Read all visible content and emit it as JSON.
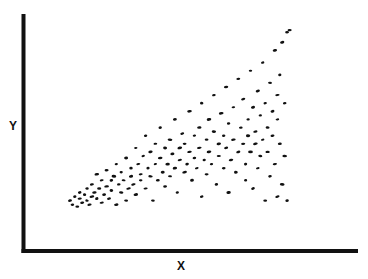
{
  "chart_data": {
    "type": "scatter",
    "title": "",
    "xlabel": "X",
    "ylabel": "Y",
    "xlim": [
      0,
      100
    ],
    "ylim": [
      0,
      100
    ],
    "grid": false,
    "legend": null,
    "ticks": false,
    "marker_color": "#111111",
    "axis_color": "#111111",
    "series": [
      {
        "name": "points",
        "points": [
          [
            9,
            12
          ],
          [
            10,
            10
          ],
          [
            11,
            14
          ],
          [
            12,
            9
          ],
          [
            13,
            13
          ],
          [
            13,
            16
          ],
          [
            14,
            11
          ],
          [
            15,
            15
          ],
          [
            16,
            12
          ],
          [
            16,
            18
          ],
          [
            17,
            10
          ],
          [
            18,
            14
          ],
          [
            18,
            20
          ],
          [
            19,
            16
          ],
          [
            20,
            13
          ],
          [
            20,
            25
          ],
          [
            21,
            18
          ],
          [
            22,
            11
          ],
          [
            22,
            22
          ],
          [
            23,
            15
          ],
          [
            24,
            19
          ],
          [
            24,
            27
          ],
          [
            25,
            13
          ],
          [
            26,
            22
          ],
          [
            26,
            17
          ],
          [
            27,
            24
          ],
          [
            28,
            10
          ],
          [
            28,
            30
          ],
          [
            29,
            20
          ],
          [
            30,
            16
          ],
          [
            30,
            26
          ],
          [
            31,
            22
          ],
          [
            32,
            33
          ],
          [
            32,
            12
          ],
          [
            33,
            18
          ],
          [
            34,
            28
          ],
          [
            34,
            24
          ],
          [
            35,
            20
          ],
          [
            36,
            38
          ],
          [
            36,
            15
          ],
          [
            37,
            30
          ],
          [
            38,
            25
          ],
          [
            38,
            22
          ],
          [
            39,
            34
          ],
          [
            40,
            18
          ],
          [
            40,
            44
          ],
          [
            41,
            28
          ],
          [
            42,
            24
          ],
          [
            42,
            36
          ],
          [
            43,
            12
          ],
          [
            44,
            30
          ],
          [
            44,
            40
          ],
          [
            45,
            22
          ],
          [
            46,
            33
          ],
          [
            46,
            48
          ],
          [
            47,
            26
          ],
          [
            48,
            38
          ],
          [
            48,
            19
          ],
          [
            49,
            30
          ],
          [
            50,
            42
          ],
          [
            50,
            24
          ],
          [
            51,
            35
          ],
          [
            52,
            28
          ],
          [
            52,
            52
          ],
          [
            53,
            16
          ],
          [
            54,
            38
          ],
          [
            54,
            32
          ],
          [
            55,
            45
          ],
          [
            56,
            26
          ],
          [
            56,
            40
          ],
          [
            57,
            30
          ],
          [
            58,
            56
          ],
          [
            58,
            36
          ],
          [
            59,
            22
          ],
          [
            60,
            44
          ],
          [
            60,
            33
          ],
          [
            61,
            28
          ],
          [
            62,
            48
          ],
          [
            62,
            38
          ],
          [
            63,
            14
          ],
          [
            63,
            60
          ],
          [
            64,
            32
          ],
          [
            65,
            42
          ],
          [
            65,
            25
          ],
          [
            66,
            52
          ],
          [
            66,
            36
          ],
          [
            67,
            30
          ],
          [
            68,
            46
          ],
          [
            68,
            64
          ],
          [
            69,
            20
          ],
          [
            70,
            40
          ],
          [
            70,
            34
          ],
          [
            71,
            55
          ],
          [
            72,
            28
          ],
          [
            72,
            44
          ],
          [
            73,
            68
          ],
          [
            73,
            38
          ],
          [
            74,
            50
          ],
          [
            74,
            16
          ],
          [
            75,
            32
          ],
          [
            76,
            42
          ],
          [
            76,
            58
          ],
          [
            77,
            26
          ],
          [
            78,
            36
          ],
          [
            78,
            72
          ],
          [
            79,
            48
          ],
          [
            80,
            40
          ],
          [
            80,
            62
          ],
          [
            81,
            22
          ],
          [
            81,
            30
          ],
          [
            82,
            52
          ],
          [
            82,
            44
          ],
          [
            83,
            76
          ],
          [
            83,
            36
          ],
          [
            84,
            58
          ],
          [
            84,
            18
          ],
          [
            85,
            46
          ],
          [
            85,
            40
          ],
          [
            86,
            66
          ],
          [
            86,
            28
          ],
          [
            87,
            54
          ],
          [
            87,
            34
          ],
          [
            88,
            80
          ],
          [
            88,
            42
          ],
          [
            89,
            60
          ],
          [
            89,
            12
          ],
          [
            90,
            48
          ],
          [
            90,
            36
          ],
          [
            91,
            70
          ],
          [
            91,
            24
          ],
          [
            92,
            56
          ],
          [
            92,
            44
          ],
          [
            93,
            86
          ],
          [
            93,
            30
          ],
          [
            94,
            64
          ],
          [
            94,
            52
          ],
          [
            94,
            14
          ],
          [
            95,
            40
          ],
          [
            95,
            74
          ],
          [
            96,
            90
          ],
          [
            96,
            20
          ],
          [
            97,
            60
          ],
          [
            97,
            34
          ],
          [
            98,
            95
          ],
          [
            98,
            12
          ],
          [
            99,
            96
          ]
        ]
      }
    ]
  }
}
